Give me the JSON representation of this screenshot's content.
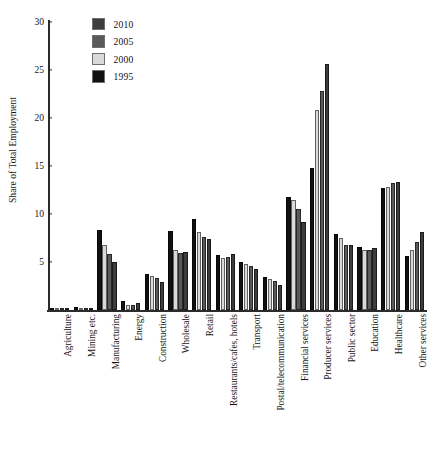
{
  "chart_data": {
    "type": "bar",
    "title": "",
    "xlabel": "",
    "ylabel": "Share of Total Employment",
    "ylim": [
      0,
      30
    ],
    "yticks": [
      5,
      10,
      15,
      20,
      25,
      30
    ],
    "grid": false,
    "legend_position": "top-left",
    "categories": [
      "Agriculture",
      "Mining etc.",
      "Manufacturing",
      "Energy",
      "Construction",
      "Wholesale",
      "Retail",
      "Restaurants/cafes, hotels",
      "Transport",
      "Postal/telecommunication",
      "Financial services",
      "Producer services",
      "Public sector",
      "Education",
      "Healthcare",
      "Other services"
    ],
    "series": [
      {
        "name": "1995",
        "color": "#111111",
        "values": [
          0.2,
          0.3,
          8.3,
          0.9,
          3.8,
          8.2,
          9.5,
          5.7,
          5.0,
          3.4,
          11.8,
          14.8,
          7.9,
          6.6,
          12.7,
          5.6
        ]
      },
      {
        "name": "2000",
        "color": "#d9d9d9",
        "values": [
          0.2,
          0.2,
          6.8,
          0.5,
          3.5,
          6.2,
          8.1,
          5.4,
          4.8,
          3.2,
          11.5,
          20.8,
          7.5,
          6.2,
          12.8,
          6.2
        ]
      },
      {
        "name": "2005",
        "color": "#595959",
        "values": [
          0.2,
          0.2,
          5.8,
          0.5,
          3.3,
          5.9,
          7.6,
          5.5,
          4.6,
          3.0,
          10.5,
          22.8,
          6.8,
          6.3,
          13.2,
          7.1
        ]
      },
      {
        "name": "2010",
        "color": "#3d3d3d",
        "values": [
          0.2,
          0.2,
          5.0,
          0.7,
          2.9,
          6.0,
          7.4,
          5.8,
          4.3,
          2.6,
          9.2,
          25.6,
          6.8,
          6.5,
          13.3,
          8.1
        ]
      }
    ]
  },
  "legend": {
    "items": [
      {
        "label": "2010",
        "color": "#3d3d3d"
      },
      {
        "label": "2005",
        "color": "#595959"
      },
      {
        "label": "2000",
        "color": "#d9d9d9"
      },
      {
        "label": "1995",
        "color": "#111111"
      }
    ]
  },
  "caption": ""
}
